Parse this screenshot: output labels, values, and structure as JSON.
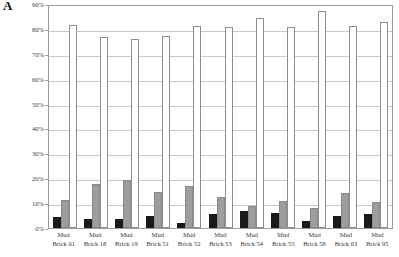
{
  "panel": {
    "letter": "A"
  },
  "chart_data": {
    "type": "bar",
    "title": "",
    "xlabel": "",
    "ylabel": "",
    "ylim": [
      0,
      90
    ],
    "grid": true,
    "legend_position": "none",
    "categories": [
      "Mud Brick 01",
      "Mud Brick 18",
      "Mud Brick 19",
      "Mud Brick 51",
      "Mud Brick 52",
      "Mud Brick 53",
      "Mud Brick 54",
      "Mud Brick 55",
      "Mud Brick 58",
      "Mud Brick 63",
      "Mud Brick 95"
    ],
    "category_lines": [
      [
        "Mud",
        "Brick 01"
      ],
      [
        "Mud",
        "Brick 18"
      ],
      [
        "Mud",
        "Brick 19"
      ],
      [
        "Mud",
        "Brick 51"
      ],
      [
        "Mud",
        "Brick 52"
      ],
      [
        "Mud",
        "Brick 53"
      ],
      [
        "Mud",
        "Brick 54"
      ],
      [
        "Mud",
        "Brick 55"
      ],
      [
        "Mud",
        "Brick 58"
      ],
      [
        "Mud",
        "Brick 63"
      ],
      [
        "Mud",
        "Brick 95"
      ]
    ],
    "yticks": [
      0,
      10,
      20,
      30,
      40,
      50,
      60,
      70,
      80,
      90
    ],
    "ytick_labels": [
      "0%",
      "10%",
      "20%",
      "30%",
      "40%",
      "50%",
      "60%",
      "70%",
      "80%",
      "90%"
    ],
    "series": [
      {
        "name": "series-black",
        "color": "#1a1a1a",
        "values": [
          4.5,
          3.5,
          3.5,
          5.0,
          2.0,
          5.5,
          7.0,
          6.0,
          3.0,
          5.0,
          5.5
        ]
      },
      {
        "name": "series-gray",
        "color": "#9d9d9d",
        "values": [
          11.5,
          18.0,
          19.5,
          14.5,
          17.0,
          12.5,
          9.0,
          11.0,
          8.0,
          14.0,
          10.5
        ]
      },
      {
        "name": "series-white",
        "color": "#ffffff",
        "values": [
          82.5,
          77.5,
          76.5,
          78.0,
          82.0,
          81.5,
          85.0,
          81.5,
          88.0,
          82.0,
          83.5
        ]
      }
    ]
  }
}
